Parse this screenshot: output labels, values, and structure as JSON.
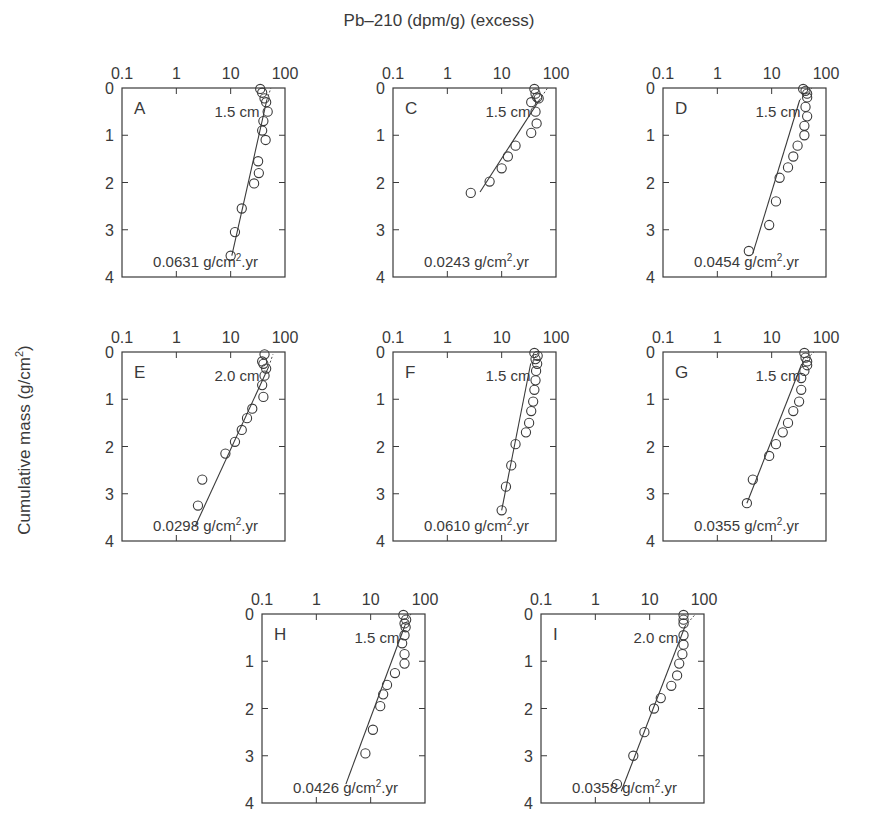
{
  "figure": {
    "title": "Pb–210 (dpm/g) (excess)",
    "ylabel": "Cumulative mass (g/cm²)",
    "colors": {
      "axis": "#3a3a3a",
      "marker": "#3a3a3a",
      "background": "#ffffff"
    }
  },
  "chart_data": [
    {
      "panel": "A",
      "type": "scatter",
      "xscale": "log",
      "xlim": [
        0.1,
        100
      ],
      "ylim": [
        4,
        0
      ],
      "xticks": [
        "0.1",
        "1",
        "10",
        "100"
      ],
      "yticks": [
        "0",
        "1",
        "2",
        "3",
        "4"
      ],
      "mixing_depth": "1.5 cm",
      "rate_value": "0.0631",
      "rate_unit": "g/cm².yr",
      "points": [
        [
          35,
          0.02
        ],
        [
          38,
          0.1
        ],
        [
          42,
          0.22
        ],
        [
          45,
          0.3
        ],
        [
          48,
          0.5
        ],
        [
          40,
          0.7
        ],
        [
          38,
          0.9
        ],
        [
          44,
          1.1
        ],
        [
          32,
          1.55
        ],
        [
          33,
          1.8
        ],
        [
          27,
          2.02
        ],
        [
          16,
          2.55
        ],
        [
          12,
          3.05
        ],
        [
          10,
          3.55
        ]
      ],
      "fit": [
        [
          10.5,
          3.55
        ],
        [
          55,
          0
        ]
      ]
    },
    {
      "panel": "C",
      "type": "scatter",
      "xscale": "log",
      "xlim": [
        0.1,
        100
      ],
      "ylim": [
        4,
        0
      ],
      "xticks": [
        "0.1",
        "1",
        "10",
        "100"
      ],
      "yticks": [
        "0",
        "1",
        "2",
        "3",
        "4"
      ],
      "mixing_depth": "1.5 cm",
      "rate_value": "0.0243",
      "rate_unit": "g/cm².yr",
      "points": [
        [
          40,
          0.02
        ],
        [
          42,
          0.12
        ],
        [
          45,
          0.2
        ],
        [
          48,
          0.22
        ],
        [
          35,
          0.3
        ],
        [
          42,
          0.5
        ],
        [
          44,
          0.75
        ],
        [
          35,
          0.95
        ],
        [
          18,
          1.22
        ],
        [
          13,
          1.45
        ],
        [
          10,
          1.7
        ],
        [
          6,
          1.98
        ],
        [
          2.7,
          2.22
        ]
      ],
      "fit": [
        [
          4,
          2.2
        ],
        [
          70,
          0
        ]
      ]
    },
    {
      "panel": "D",
      "type": "scatter",
      "xscale": "log",
      "xlim": [
        0.1,
        100
      ],
      "ylim": [
        4,
        0
      ],
      "xticks": [
        "0.1",
        "1",
        "10",
        "100"
      ],
      "yticks": [
        "0",
        "1",
        "2",
        "3",
        "4"
      ],
      "mixing_depth": "1.5 cm",
      "rate_value": "0.0454",
      "rate_unit": "g/cm².yr",
      "points": [
        [
          38,
          0.02
        ],
        [
          42,
          0.06
        ],
        [
          45,
          0.12
        ],
        [
          45,
          0.2
        ],
        [
          42,
          0.4
        ],
        [
          45,
          0.6
        ],
        [
          40,
          0.8
        ],
        [
          40,
          1.0
        ],
        [
          30,
          1.22
        ],
        [
          25,
          1.45
        ],
        [
          20,
          1.68
        ],
        [
          14,
          1.9
        ],
        [
          12,
          2.4
        ],
        [
          9,
          2.9
        ],
        [
          3.8,
          3.45
        ]
      ],
      "fit": [
        [
          4.5,
          3.5
        ],
        [
          55,
          0
        ]
      ]
    },
    {
      "panel": "E",
      "type": "scatter",
      "xscale": "log",
      "xlim": [
        0.1,
        100
      ],
      "ylim": [
        4,
        0
      ],
      "xticks": [
        "0.1",
        "1",
        "10",
        "100"
      ],
      "yticks": [
        "0",
        "1",
        "2",
        "3",
        "4"
      ],
      "mixing_depth": "2.0 cm",
      "rate_value": "0.0298",
      "rate_unit": "g/cm².yr",
      "points": [
        [
          42,
          0.05
        ],
        [
          38,
          0.2
        ],
        [
          40,
          0.25
        ],
        [
          45,
          0.35
        ],
        [
          42,
          0.5
        ],
        [
          38,
          0.7
        ],
        [
          40,
          0.95
        ],
        [
          25,
          1.2
        ],
        [
          20,
          1.4
        ],
        [
          16,
          1.65
        ],
        [
          12,
          1.9
        ],
        [
          8,
          2.15
        ],
        [
          3,
          2.7
        ],
        [
          2.5,
          3.25
        ]
      ],
      "fit": [
        [
          2.2,
          3.7
        ],
        [
          60,
          0.05
        ]
      ]
    },
    {
      "panel": "F",
      "type": "scatter",
      "xscale": "log",
      "xlim": [
        0.1,
        100
      ],
      "ylim": [
        4,
        0
      ],
      "xticks": [
        "0.1",
        "1",
        "10",
        "100"
      ],
      "yticks": [
        "0",
        "1",
        "2",
        "3",
        "4"
      ],
      "mixing_depth": "1.5 cm",
      "rate_value": "0.0610",
      "rate_unit": "g/cm².yr",
      "points": [
        [
          40,
          0.02
        ],
        [
          46,
          0.08
        ],
        [
          42,
          0.15
        ],
        [
          45,
          0.25
        ],
        [
          43,
          0.4
        ],
        [
          42,
          0.6
        ],
        [
          40,
          0.8
        ],
        [
          38,
          1.05
        ],
        [
          35,
          1.25
        ],
        [
          32,
          1.5
        ],
        [
          28,
          1.7
        ],
        [
          18,
          1.95
        ],
        [
          15,
          2.4
        ],
        [
          12,
          2.85
        ],
        [
          10,
          3.35
        ]
      ],
      "fit": [
        [
          10,
          3.35
        ],
        [
          48,
          0
        ]
      ]
    },
    {
      "panel": "G",
      "type": "scatter",
      "xscale": "log",
      "xlim": [
        0.1,
        100
      ],
      "ylim": [
        4,
        0
      ],
      "xticks": [
        "0.1",
        "1",
        "10",
        "100"
      ],
      "yticks": [
        "0",
        "1",
        "2",
        "3",
        "4"
      ],
      "mixing_depth": "1.5 cm",
      "rate_value": "0.0355",
      "rate_unit": "g/cm².yr",
      "points": [
        [
          40,
          0.02
        ],
        [
          42,
          0.12
        ],
        [
          45,
          0.2
        ],
        [
          45,
          0.28
        ],
        [
          40,
          0.4
        ],
        [
          35,
          0.55
        ],
        [
          35,
          0.8
        ],
        [
          32,
          1.05
        ],
        [
          25,
          1.25
        ],
        [
          20,
          1.5
        ],
        [
          16,
          1.7
        ],
        [
          12,
          1.95
        ],
        [
          9,
          2.2
        ],
        [
          4.5,
          2.7
        ],
        [
          3.5,
          3.2
        ]
      ],
      "fit": [
        [
          3.5,
          3.2
        ],
        [
          60,
          0
        ]
      ]
    },
    {
      "panel": "H",
      "type": "scatter",
      "xscale": "log",
      "xlim": [
        0.1,
        100
      ],
      "ylim": [
        4,
        0
      ],
      "xticks": [
        "0.1",
        "1",
        "10",
        "100"
      ],
      "yticks": [
        "0",
        "1",
        "2",
        "3",
        "4"
      ],
      "mixing_depth": "1.5 cm",
      "rate_value": "0.0426",
      "rate_unit": "g/cm².yr",
      "points": [
        [
          40,
          0.02
        ],
        [
          45,
          0.12
        ],
        [
          42,
          0.2
        ],
        [
          44,
          0.28
        ],
        [
          42,
          0.45
        ],
        [
          38,
          0.62
        ],
        [
          42,
          0.85
        ],
        [
          42,
          1.05
        ],
        [
          28,
          1.25
        ],
        [
          20,
          1.5
        ],
        [
          17,
          1.7
        ],
        [
          15,
          1.95
        ],
        [
          11,
          2.45
        ],
        [
          8,
          2.95
        ]
      ],
      "fit": [
        [
          3.5,
          3.6
        ],
        [
          55,
          0
        ]
      ]
    },
    {
      "panel": "I",
      "type": "scatter",
      "xscale": "log",
      "xlim": [
        0.1,
        100
      ],
      "ylim": [
        4,
        0
      ],
      "xticks": [
        "0.1",
        "1",
        "10",
        "100"
      ],
      "yticks": [
        "0",
        "1",
        "2",
        "3",
        "4"
      ],
      "mixing_depth": "2.0 cm",
      "rate_value": "0.0358",
      "rate_unit": "g/cm².yr",
      "points": [
        [
          42,
          0.02
        ],
        [
          42,
          0.12
        ],
        [
          42,
          0.2
        ],
        [
          42,
          0.45
        ],
        [
          42,
          0.65
        ],
        [
          40,
          0.85
        ],
        [
          35,
          1.05
        ],
        [
          32,
          1.3
        ],
        [
          25,
          1.52
        ],
        [
          16,
          1.78
        ],
        [
          12,
          2.0
        ],
        [
          8,
          2.5
        ],
        [
          5,
          3.0
        ],
        [
          2.5,
          3.6
        ]
      ],
      "fit": [
        [
          3,
          3.75
        ],
        [
          70,
          0
        ]
      ]
    }
  ],
  "layout": {
    "panels": [
      {
        "id": "A",
        "x": 122,
        "y": 88,
        "w": 163,
        "h": 189
      },
      {
        "id": "C",
        "x": 393,
        "y": 88,
        "w": 163,
        "h": 189
      },
      {
        "id": "D",
        "x": 663,
        "y": 88,
        "w": 163,
        "h": 189
      },
      {
        "id": "E",
        "x": 122,
        "y": 352,
        "w": 163,
        "h": 189
      },
      {
        "id": "F",
        "x": 393,
        "y": 352,
        "w": 163,
        "h": 189
      },
      {
        "id": "G",
        "x": 663,
        "y": 352,
        "w": 163,
        "h": 189
      },
      {
        "id": "H",
        "x": 262,
        "y": 614,
        "w": 163,
        "h": 189
      },
      {
        "id": "I",
        "x": 541,
        "y": 614,
        "w": 163,
        "h": 189
      }
    ]
  }
}
